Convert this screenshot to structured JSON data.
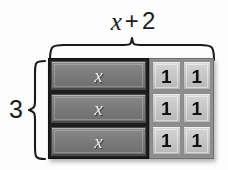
{
  "diagram": {
    "kind": "algebra-tiles-area-model",
    "background_color": "#fdfdfd",
    "top_label": {
      "variable": "x",
      "operator": "+",
      "constant": "2",
      "full_text": "x + 2"
    },
    "side_label": {
      "value": "3"
    },
    "braces": {
      "top": {
        "name": "top-brace",
        "color": "#1b1b1b",
        "span_label": "x + 2"
      },
      "left": {
        "name": "left-brace",
        "color": "#1b1b1b",
        "span_label": "3"
      }
    },
    "tiles": {
      "x_tile_label": "x",
      "unit_tile_label": "1",
      "rows": 3,
      "x_tiles_per_row": 1,
      "unit_tiles_per_row": 2,
      "x_tile_color": "#7b7b7b",
      "x_tile_text_color": "#f2f2f2",
      "x_frame_color": "#1d1d1d",
      "unit_tile_color": "#c6c6c6",
      "unit_tile_text_color": "#121212",
      "unit_frame_color": "#8f8f8f"
    },
    "grid": [
      {
        "x": "x",
        "units": [
          "1",
          "1"
        ]
      },
      {
        "x": "x",
        "units": [
          "1",
          "1"
        ]
      },
      {
        "x": "x",
        "units": [
          "1",
          "1"
        ]
      }
    ]
  }
}
